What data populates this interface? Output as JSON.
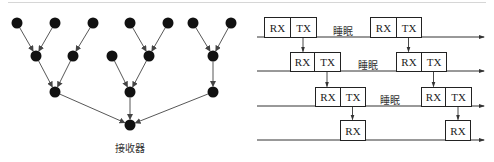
{
  "left_diagram": {
    "title": "树形数据汇聚网络",
    "receiver_label": "接收器",
    "node_color": "#111111",
    "edge_color": "#444444",
    "nodes": [
      {
        "id": "l1a",
        "x": 17,
        "y": 23
      },
      {
        "id": "l1b",
        "x": 55,
        "y": 23
      },
      {
        "id": "l1c",
        "x": 93,
        "y": 23
      },
      {
        "id": "l1d",
        "x": 130,
        "y": 23
      },
      {
        "id": "l1e",
        "x": 168,
        "y": 23
      },
      {
        "id": "l1f",
        "x": 193,
        "y": 23
      },
      {
        "id": "l1g",
        "x": 231,
        "y": 23
      },
      {
        "id": "l2a",
        "x": 36,
        "y": 56
      },
      {
        "id": "l2b",
        "x": 73,
        "y": 56
      },
      {
        "id": "l2c",
        "x": 112,
        "y": 56
      },
      {
        "id": "l2d",
        "x": 149,
        "y": 56
      },
      {
        "id": "l2e",
        "x": 213,
        "y": 56
      },
      {
        "id": "l3a",
        "x": 55,
        "y": 92
      },
      {
        "id": "l3b",
        "x": 130,
        "y": 92
      },
      {
        "id": "l3c",
        "x": 213,
        "y": 92
      },
      {
        "id": "sink",
        "x": 130,
        "y": 125
      }
    ],
    "edges": [
      [
        "l1a",
        "l2a"
      ],
      [
        "l1b",
        "l2a"
      ],
      [
        "l1c",
        "l2b"
      ],
      [
        "l1d",
        "l2d"
      ],
      [
        "l1e",
        "l2d"
      ],
      [
        "l1f",
        "l2e"
      ],
      [
        "l1g",
        "l2e"
      ],
      [
        "l2a",
        "l3a"
      ],
      [
        "l2b",
        "l3a"
      ],
      [
        "l2c",
        "l3b"
      ],
      [
        "l2d",
        "l3b"
      ],
      [
        "l2e",
        "l3c"
      ],
      [
        "l3a",
        "sink"
      ],
      [
        "l3b",
        "sink"
      ],
      [
        "l3c",
        "sink"
      ]
    ]
  },
  "right_diagram": {
    "title": "逐级RX/TX调度时序",
    "sleep_label": "睡眠",
    "rx_label": "RX",
    "tx_label": "TX",
    "line_start_x": 257,
    "line_end_x": 484,
    "timelines": [
      {
        "y": 37,
        "box_top": 17,
        "groups": [
          {
            "rx": [
              264,
              290
            ],
            "tx": [
              290,
              316
            ]
          },
          {
            "rx": [
              370,
              396
            ],
            "tx": [
              396,
              421
            ]
          }
        ],
        "sleep_x": 333
      },
      {
        "y": 71,
        "box_top": 52,
        "groups": [
          {
            "rx": [
              290,
              314
            ],
            "tx": [
              314,
              340
            ]
          },
          {
            "rx": [
              396,
              421
            ],
            "tx": [
              421,
              446
            ]
          }
        ],
        "sleep_x": 358
      },
      {
        "y": 106,
        "box_top": 87,
        "groups": [
          {
            "rx": [
              315,
              340
            ],
            "tx": [
              340,
              365
            ]
          },
          {
            "rx": [
              421,
              445
            ],
            "tx": [
              445,
              471
            ]
          }
        ],
        "sleep_x": 380
      },
      {
        "y": 140,
        "box_top": 120,
        "groups": [
          {
            "rx": [
              340,
              365
            ]
          },
          {
            "rx": [
              445,
              470
            ]
          }
        ],
        "sleep_x": null
      }
    ]
  }
}
